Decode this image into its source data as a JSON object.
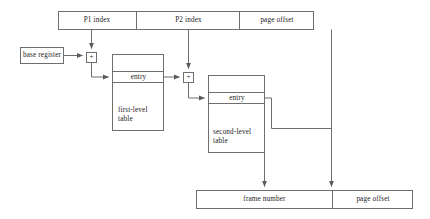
{
  "diagram": {
    "virtual_address_bar": {
      "name": "virtual-address",
      "fields": [
        {
          "label": "P1 index"
        },
        {
          "label": "P2 index"
        },
        {
          "label": "page offset"
        }
      ]
    },
    "base_register": {
      "label": "base register"
    },
    "adders": [
      {
        "name": "adder-1",
        "label": "+"
      },
      {
        "name": "adder-2",
        "label": "+"
      }
    ],
    "first_level_table": {
      "entry_label": "entry",
      "table_label": "first-level\ntable",
      "table_label_line1": "first-level",
      "table_label_line2": "table"
    },
    "second_level_table": {
      "entry_label": "entry",
      "table_label_line1": "second-level",
      "table_label_line2": "table"
    },
    "physical_address_bar": {
      "name": "physical-address",
      "fields": [
        {
          "label": "frame number"
        },
        {
          "label": "page offset"
        }
      ]
    },
    "colors": {
      "stroke": "#6e6e6e",
      "stroke_dark": "#555555",
      "text": "#1b1b1b",
      "background": "#ffffff"
    }
  }
}
